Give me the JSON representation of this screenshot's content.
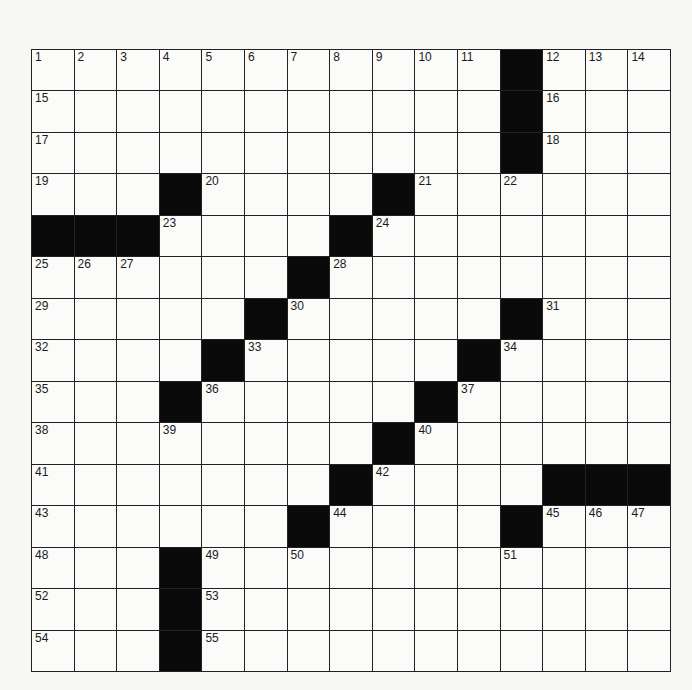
{
  "puzzle": {
    "rows": 15,
    "cols": 15,
    "colors": {
      "block": "#0a0a0a",
      "cell": "#fbfbf9",
      "line": "#222222"
    },
    "blocks": [
      [
        0,
        11
      ],
      [
        1,
        11
      ],
      [
        2,
        11
      ],
      [
        3,
        3
      ],
      [
        3,
        8
      ],
      [
        4,
        0
      ],
      [
        4,
        1
      ],
      [
        4,
        2
      ],
      [
        4,
        7
      ],
      [
        5,
        6
      ],
      [
        6,
        5
      ],
      [
        6,
        11
      ],
      [
        7,
        4
      ],
      [
        7,
        10
      ],
      [
        8,
        3
      ],
      [
        8,
        9
      ],
      [
        9,
        8
      ],
      [
        10,
        7
      ],
      [
        10,
        12
      ],
      [
        10,
        13
      ],
      [
        10,
        14
      ],
      [
        11,
        6
      ],
      [
        11,
        11
      ],
      [
        12,
        3
      ],
      [
        13,
        3
      ],
      [
        14,
        3
      ]
    ],
    "numbers": [
      {
        "r": 0,
        "c": 0,
        "n": "1"
      },
      {
        "r": 0,
        "c": 1,
        "n": "2"
      },
      {
        "r": 0,
        "c": 2,
        "n": "3"
      },
      {
        "r": 0,
        "c": 3,
        "n": "4"
      },
      {
        "r": 0,
        "c": 4,
        "n": "5"
      },
      {
        "r": 0,
        "c": 5,
        "n": "6"
      },
      {
        "r": 0,
        "c": 6,
        "n": "7"
      },
      {
        "r": 0,
        "c": 7,
        "n": "8"
      },
      {
        "r": 0,
        "c": 8,
        "n": "9"
      },
      {
        "r": 0,
        "c": 9,
        "n": "10"
      },
      {
        "r": 0,
        "c": 10,
        "n": "11"
      },
      {
        "r": 0,
        "c": 12,
        "n": "12"
      },
      {
        "r": 0,
        "c": 13,
        "n": "13"
      },
      {
        "r": 0,
        "c": 14,
        "n": "14"
      },
      {
        "r": 1,
        "c": 0,
        "n": "15"
      },
      {
        "r": 1,
        "c": 12,
        "n": "16"
      },
      {
        "r": 2,
        "c": 0,
        "n": "17"
      },
      {
        "r": 2,
        "c": 12,
        "n": "18"
      },
      {
        "r": 3,
        "c": 0,
        "n": "19"
      },
      {
        "r": 3,
        "c": 4,
        "n": "20"
      },
      {
        "r": 3,
        "c": 9,
        "n": "21"
      },
      {
        "r": 3,
        "c": 11,
        "n": "22"
      },
      {
        "r": 4,
        "c": 3,
        "n": "23"
      },
      {
        "r": 4,
        "c": 8,
        "n": "24"
      },
      {
        "r": 5,
        "c": 0,
        "n": "25"
      },
      {
        "r": 5,
        "c": 1,
        "n": "26"
      },
      {
        "r": 5,
        "c": 2,
        "n": "27"
      },
      {
        "r": 5,
        "c": 7,
        "n": "28"
      },
      {
        "r": 6,
        "c": 0,
        "n": "29"
      },
      {
        "r": 6,
        "c": 6,
        "n": "30"
      },
      {
        "r": 6,
        "c": 12,
        "n": "31"
      },
      {
        "r": 7,
        "c": 0,
        "n": "32"
      },
      {
        "r": 7,
        "c": 5,
        "n": "33"
      },
      {
        "r": 7,
        "c": 11,
        "n": "34"
      },
      {
        "r": 8,
        "c": 0,
        "n": "35"
      },
      {
        "r": 8,
        "c": 4,
        "n": "36"
      },
      {
        "r": 8,
        "c": 10,
        "n": "37"
      },
      {
        "r": 9,
        "c": 0,
        "n": "38"
      },
      {
        "r": 9,
        "c": 3,
        "n": "39"
      },
      {
        "r": 9,
        "c": 9,
        "n": "40"
      },
      {
        "r": 10,
        "c": 0,
        "n": "41"
      },
      {
        "r": 10,
        "c": 8,
        "n": "42"
      },
      {
        "r": 11,
        "c": 0,
        "n": "43"
      },
      {
        "r": 11,
        "c": 7,
        "n": "44"
      },
      {
        "r": 11,
        "c": 12,
        "n": "45"
      },
      {
        "r": 11,
        "c": 13,
        "n": "46"
      },
      {
        "r": 11,
        "c": 14,
        "n": "47"
      },
      {
        "r": 12,
        "c": 0,
        "n": "48"
      },
      {
        "r": 12,
        "c": 4,
        "n": "49"
      },
      {
        "r": 12,
        "c": 6,
        "n": "50"
      },
      {
        "r": 12,
        "c": 11,
        "n": "51"
      },
      {
        "r": 13,
        "c": 0,
        "n": "52"
      },
      {
        "r": 13,
        "c": 4,
        "n": "53"
      },
      {
        "r": 14,
        "c": 0,
        "n": "54"
      },
      {
        "r": 14,
        "c": 4,
        "n": "55"
      }
    ]
  }
}
